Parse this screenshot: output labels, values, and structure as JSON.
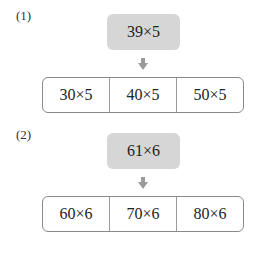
{
  "problems": [
    {
      "label": "(1)",
      "expression": "39×5",
      "options": [
        "30×5",
        "40×5",
        "50×5"
      ]
    },
    {
      "label": "(2)",
      "expression": "61×6",
      "options": [
        "60×6",
        "70×6",
        "80×6"
      ]
    }
  ],
  "colors": {
    "source_box": "#d6d6d6",
    "arrow": "#9a9a9a",
    "border": "#8a8a8a"
  },
  "icons": {
    "arrow": "down-arrow-icon"
  }
}
